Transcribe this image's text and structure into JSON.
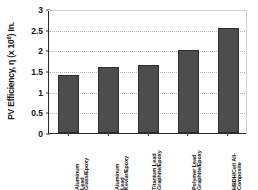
{
  "chart_data": {
    "type": "bar",
    "title": "",
    "xlabel": "",
    "ylabel": "PV Efficiency, η (x 10⁶) In.",
    "ylabel_parts": {
      "prefix": "PV Efficiency, η (x 10",
      "exponent": "6",
      "suffix": ") In."
    },
    "categories": [
      "Aluminum Lead Glass/Epoxy",
      "Aluminum Lead Kevlar/Epoxy",
      "Titanium Lead Graphite/Epoxy",
      "Polymer Lead Graphite/Epoxy",
      "HBDH/Cell All-Composite"
    ],
    "category_lines": [
      [
        "Aluminum",
        "Lead",
        "Glass/Epoxy"
      ],
      [
        "Aluminum",
        "Lead",
        "Kevlar/Epoxy"
      ],
      [
        "Titanium Lead",
        "Graphite/Epoxy"
      ],
      [
        "Polymer Lead",
        "Graphite/Epoxy"
      ],
      [
        "HBDH/Cell All-",
        "Composite"
      ]
    ],
    "values": [
      1.4,
      1.6,
      1.65,
      2.02,
      2.53
    ],
    "ylim": [
      0,
      3
    ],
    "yticks": [
      "0",
      "0.5",
      "1",
      "1.5",
      "2",
      "2.5",
      "3"
    ],
    "ytick_values": [
      0,
      0.5,
      1,
      1.5,
      2,
      2.5,
      3
    ],
    "grid": true,
    "legend": "none",
    "bar_color": "#4d4d4d",
    "bar_edge_color": "#2e2e2e",
    "grid_color": "#b9b9b9",
    "axis_color": "#2b2b2b",
    "background": "#ffffff"
  }
}
